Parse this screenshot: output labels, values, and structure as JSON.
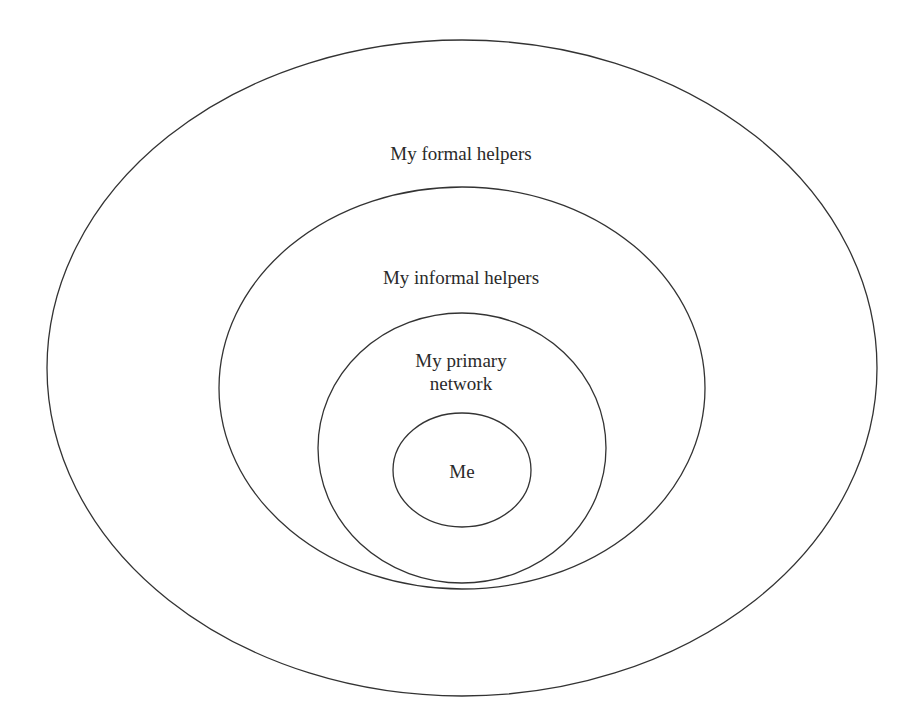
{
  "diagram": {
    "type": "concentric-ellipses",
    "rings": [
      {
        "id": "formal",
        "label": "My formal helpers",
        "cx": 462,
        "cy": 368,
        "rx": 415,
        "ry": 328,
        "label_x": 461,
        "label_y": 142
      },
      {
        "id": "informal",
        "label": "My informal helpers",
        "cx": 462,
        "cy": 388,
        "rx": 243,
        "ry": 201,
        "label_x": 461,
        "label_y": 266
      },
      {
        "id": "primary",
        "label_line1": "My primary",
        "label_line2": "network",
        "cx": 462,
        "cy": 448,
        "rx": 144,
        "ry": 135,
        "label_x": 461,
        "label_y": 349
      },
      {
        "id": "me",
        "label": "Me",
        "cx": 462,
        "cy": 470,
        "rx": 69,
        "ry": 57,
        "label_x": 462,
        "label_y": 462
      }
    ],
    "stroke_color": "#333333",
    "background_color": "#ffffff"
  }
}
